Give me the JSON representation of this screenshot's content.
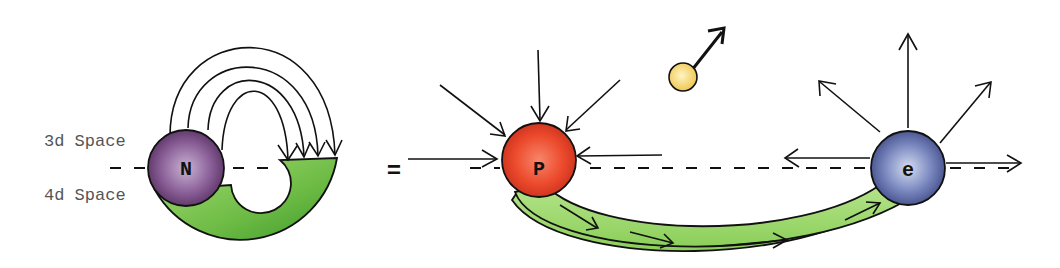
{
  "diagram": {
    "labels": {
      "space_3d": "3d Space",
      "space_4d": "4d Space",
      "equals": "="
    },
    "particles": {
      "neutron": {
        "letter": "N",
        "color": "#6a3f78"
      },
      "proton": {
        "letter": "P",
        "color": "#e8402a"
      },
      "electron": {
        "letter": "e",
        "color": "#5a6aa8"
      },
      "neutrino": {
        "letter": "",
        "color": "#f4d26a"
      }
    },
    "colors": {
      "tube_green": "#8ccf5a",
      "tube_green_dark": "#3d9a2a",
      "line": "#111111"
    }
  }
}
